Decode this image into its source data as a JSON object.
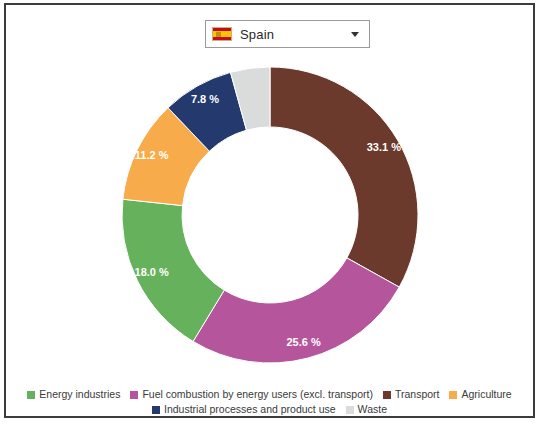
{
  "selector": {
    "name": "country-selector",
    "value": "Spain",
    "flag_icon": "flag-spain-icon",
    "caret_icon": "chevron-down-icon"
  },
  "chart_data": {
    "type": "pie",
    "variant": "donut",
    "title": "",
    "subtitle": "",
    "xlabel": "",
    "ylabel": "",
    "grid": false,
    "legend_position": "bottom",
    "start_angle_deg": 0,
    "direction": "clockwise",
    "unit": "%",
    "categories": [
      "Transport",
      "Fuel combustion by energy users (excl. transport)",
      "Energy industries",
      "Agriculture",
      "Industrial processes and product use",
      "Waste"
    ],
    "values": [
      33.1,
      25.6,
      18.0,
      11.2,
      7.8,
      4.3
    ],
    "labels": [
      "33.1 %",
      "25.6 %",
      "18.0 %",
      "11.2 %",
      "7.8 %",
      ""
    ],
    "colors": [
      "#6b3a2c",
      "#b5569c",
      "#66b15c",
      "#f7ab4a",
      "#243a6e",
      "#d9dcdb"
    ]
  },
  "legend": {
    "row1": [
      {
        "label": "Energy industries",
        "color": "#66b15c"
      },
      {
        "label": "Fuel combustion by energy users (excl. transport)",
        "color": "#b5569c"
      },
      {
        "label": "Transport",
        "color": "#6b3a2c"
      },
      {
        "label": "Agriculture",
        "color": "#f7ab4a"
      }
    ],
    "row2": [
      {
        "label": "Industrial processes and product use",
        "color": "#243a6e"
      },
      {
        "label": "Waste",
        "color": "#d9dcdb"
      }
    ]
  }
}
